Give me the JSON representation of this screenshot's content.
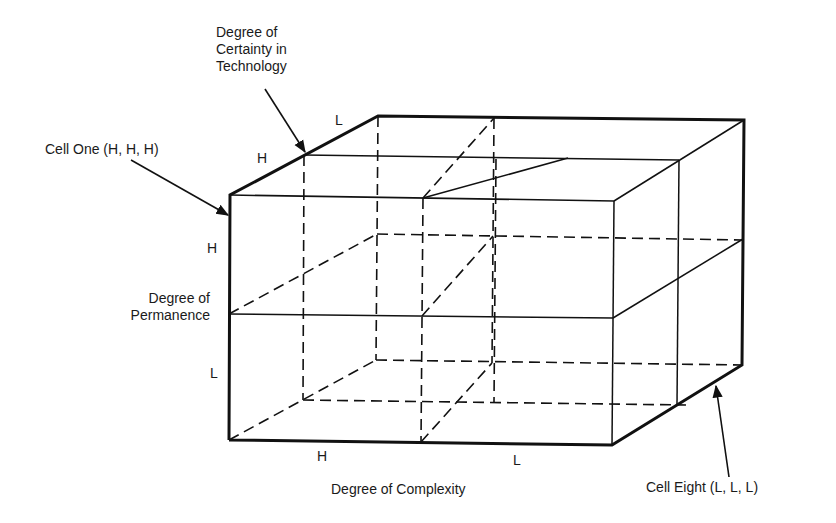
{
  "diagram": {
    "type": "3d-cube-2x2x2",
    "axes": {
      "technology": {
        "title": [
          "Degree of",
          "Certainty in",
          "Technology"
        ],
        "high": "H",
        "low": "L"
      },
      "permanence": {
        "title": [
          "Degree of",
          "Permanence"
        ],
        "high": "H",
        "low": "L"
      },
      "complexity": {
        "title": "Degree of Complexity",
        "high": "H",
        "low": "L"
      }
    },
    "callouts": {
      "cell_one": "Cell One (H, H, H)",
      "cell_eight": "Cell Eight (L, L, L)"
    },
    "colors": {
      "line": "#111111",
      "background": "#ffffff"
    }
  }
}
